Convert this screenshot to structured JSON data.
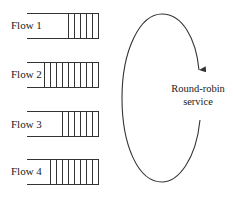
{
  "diagram": {
    "flows": [
      {
        "label": "Flow 1",
        "packets": 5
      },
      {
        "label": "Flow 2",
        "packets": 9
      },
      {
        "label": "Flow 3",
        "packets": 6
      },
      {
        "label": "Flow 4",
        "packets": 8
      }
    ],
    "service": {
      "line1": "Round-robin",
      "line2": "service"
    },
    "colors": {
      "stroke": "#333333",
      "text": "#1a1a1a"
    }
  }
}
